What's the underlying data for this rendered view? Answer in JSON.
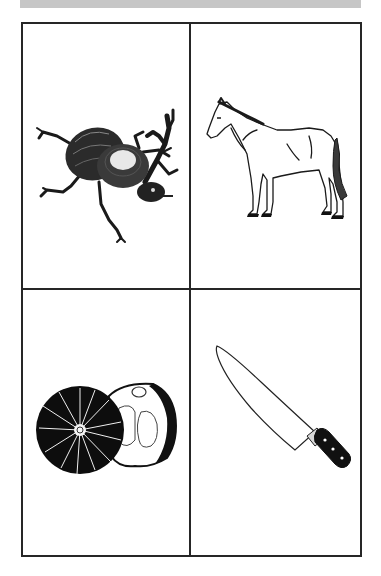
{
  "banner": {
    "color": "#c6c6c6"
  },
  "grid": {
    "rows": 2,
    "columns": 2,
    "border_color": "#262626",
    "cells": [
      {
        "label": "beetle",
        "icon": "beetle-icon"
      },
      {
        "label": "horse",
        "icon": "horse-icon"
      },
      {
        "label": "pumpkin",
        "icon": "pumpkin-icon"
      },
      {
        "label": "knife",
        "icon": "knife-icon"
      }
    ]
  }
}
